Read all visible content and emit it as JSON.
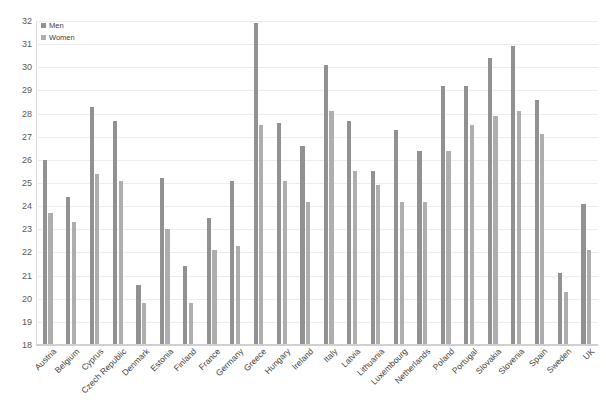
{
  "chart_data": {
    "type": "bar",
    "title": "",
    "subtitle": "",
    "xlabel": "",
    "ylabel": "",
    "ylim": [
      18,
      32
    ],
    "ytick_step": 1,
    "yticks": [
      18,
      19,
      20,
      21,
      22,
      23,
      24,
      25,
      26,
      27,
      28,
      29,
      30,
      31,
      32
    ],
    "grid": true,
    "legend_position": "top-left",
    "categories": [
      "Austria",
      "Belgium",
      "Cyprus",
      "Czech Republic",
      "Denmark",
      "Estonia",
      "Finland",
      "France",
      "Germany",
      "Greece",
      "Hungary",
      "Ireland",
      "Italy",
      "Latvia",
      "Lithuania",
      "Luxembourg",
      "Netherlands",
      "Poland",
      "Portugal",
      "Slovakia",
      "Slovenia",
      "Spain",
      "Sweden",
      "UK"
    ],
    "series": [
      {
        "name": "Men",
        "color": "#919191",
        "values": [
          26.0,
          24.4,
          28.3,
          27.7,
          20.6,
          25.2,
          21.4,
          23.5,
          25.1,
          31.9,
          27.6,
          26.6,
          30.1,
          27.7,
          25.5,
          27.3,
          26.4,
          29.2,
          29.2,
          30.4,
          30.9,
          28.6,
          21.1,
          24.1
        ]
      },
      {
        "name": "Women",
        "color": "#aeaeae",
        "values": [
          23.7,
          23.3,
          25.4,
          25.1,
          19.8,
          23.0,
          19.8,
          22.1,
          22.3,
          27.5,
          25.1,
          24.2,
          28.1,
          25.5,
          24.9,
          24.2,
          24.2,
          26.4,
          27.5,
          27.9,
          28.1,
          27.1,
          20.3,
          22.1
        ]
      }
    ],
    "legend": [
      {
        "label": "Men",
        "swatch": "men-swatch",
        "color": "#919191"
      },
      {
        "label": "Women",
        "swatch": "women-swatch",
        "color": "#aeaeae"
      }
    ]
  }
}
